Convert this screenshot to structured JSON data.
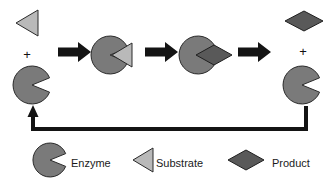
{
  "diagram": {
    "type": "process-cycle",
    "background_color": "#ffffff",
    "colors": {
      "enzyme": "#7a7a7a",
      "substrate": "#b9b9b9",
      "product": "#595959",
      "arrow": "#141414",
      "outline": "#1f1f1f",
      "text": "#1a1a1a"
    },
    "operators": {
      "plus_left": "+",
      "plus_right": "+"
    },
    "steps": [
      {
        "index": 1,
        "name": "free-enzyme-and-substrate",
        "shapes": [
          "substrate",
          "enzyme"
        ],
        "operator": "+"
      },
      {
        "index": 2,
        "name": "enzyme-substrate-complex",
        "shapes": [
          "enzyme",
          "substrate"
        ]
      },
      {
        "index": 3,
        "name": "enzyme-product-complex",
        "shapes": [
          "enzyme",
          "product"
        ]
      },
      {
        "index": 4,
        "name": "free-enzyme-and-product",
        "shapes": [
          "product",
          "enzyme"
        ],
        "operator": "+"
      }
    ],
    "arrows": [
      {
        "index": 1,
        "name": "reaction-arrow-1",
        "direction": "right"
      },
      {
        "index": 2,
        "name": "reaction-arrow-2",
        "direction": "right"
      },
      {
        "index": 3,
        "name": "reaction-arrow-3",
        "direction": "right"
      }
    ],
    "recycle_arrow": {
      "name": "enzyme-recycle-arrow",
      "direction": "right-to-left",
      "head": "up"
    },
    "legend": {
      "items": [
        {
          "key": "enzyme",
          "label": "Enzyme",
          "shape": "pacman",
          "color": "#7a7a7a"
        },
        {
          "key": "substrate",
          "label": "Substrate",
          "shape": "triangle-left",
          "color": "#b9b9b9"
        },
        {
          "key": "product",
          "label": "Product",
          "shape": "diamond",
          "color": "#595959"
        }
      ]
    }
  }
}
